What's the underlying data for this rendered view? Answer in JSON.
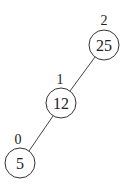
{
  "diagram": {
    "type": "binary-tree",
    "nodes": [
      {
        "id": "n25",
        "value": "25",
        "label": "2",
        "cx": 104,
        "cy": 45,
        "r": 15,
        "lx": 104,
        "ly": 20
      },
      {
        "id": "n12",
        "value": "12",
        "label": "1",
        "cx": 61,
        "cy": 103,
        "r": 15,
        "lx": 60,
        "ly": 79
      },
      {
        "id": "n5",
        "value": "5",
        "label": "0",
        "cx": 20,
        "cy": 163,
        "r": 15,
        "lx": 18,
        "ly": 139
      }
    ],
    "edges": [
      {
        "from": "n25",
        "to": "n12"
      },
      {
        "from": "n12",
        "to": "n5"
      }
    ]
  }
}
